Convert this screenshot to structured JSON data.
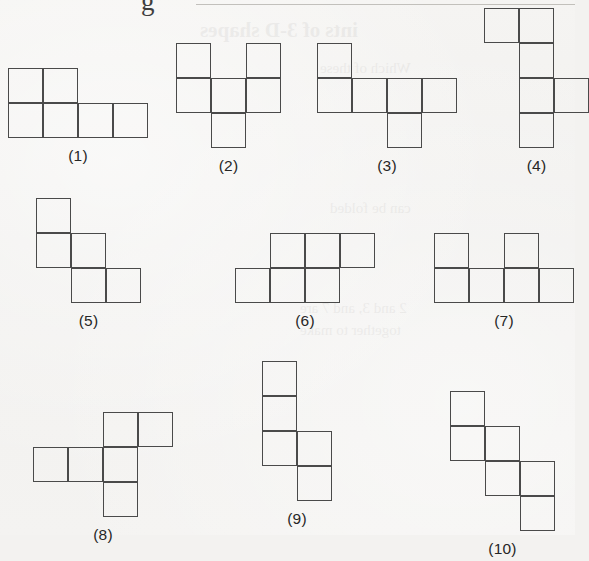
{
  "page": {
    "background_color": "#f3f2f0",
    "ink_color": "#4a4a4a",
    "caption_color": "#262626",
    "cell_size_px": 35,
    "top_glyph": "g",
    "bleed_through_text": [
      "ints of 3-D shapes",
      "Which of these",
      "can be folded",
      "2 and 3, and 7 are",
      "together to make"
    ]
  },
  "figures": [
    {
      "id": "figure-1",
      "caption": "(1)",
      "left": 8,
      "top": 68,
      "cell": 35,
      "cols": 4,
      "rows": 2,
      "cells": [
        {
          "r": 0,
          "c": 0
        },
        {
          "r": 0,
          "c": 1
        },
        {
          "r": 1,
          "c": 0
        },
        {
          "r": 1,
          "c": 1
        },
        {
          "r": 1,
          "c": 2
        },
        {
          "r": 1,
          "c": 3
        }
      ]
    },
    {
      "id": "figure-2",
      "caption": "(2)",
      "left": 176,
      "top": 43,
      "cell": 35,
      "cols": 3,
      "rows": 3,
      "cells": [
        {
          "r": 0,
          "c": 0
        },
        {
          "r": 0,
          "c": 2
        },
        {
          "r": 1,
          "c": 0
        },
        {
          "r": 1,
          "c": 1
        },
        {
          "r": 1,
          "c": 2
        },
        {
          "r": 2,
          "c": 1
        }
      ]
    },
    {
      "id": "figure-3",
      "caption": "(3)",
      "left": 317,
      "top": 43,
      "cell": 35,
      "cols": 4,
      "rows": 3,
      "cells": [
        {
          "r": 0,
          "c": 0
        },
        {
          "r": 1,
          "c": 0
        },
        {
          "r": 1,
          "c": 1
        },
        {
          "r": 1,
          "c": 2
        },
        {
          "r": 1,
          "c": 3
        },
        {
          "r": 2,
          "c": 2
        }
      ]
    },
    {
      "id": "figure-4",
      "caption": "(4)",
      "left": 484,
      "top": 8,
      "cell": 35,
      "cols": 3,
      "rows": 4,
      "cells": [
        {
          "r": 0,
          "c": 0
        },
        {
          "r": 0,
          "c": 1
        },
        {
          "r": 1,
          "c": 1
        },
        {
          "r": 2,
          "c": 1
        },
        {
          "r": 2,
          "c": 2
        },
        {
          "r": 3,
          "c": 1
        }
      ]
    },
    {
      "id": "figure-5",
      "caption": "(5)",
      "left": 36,
      "top": 198,
      "cell": 35,
      "cols": 3,
      "rows": 3,
      "cells": [
        {
          "r": 0,
          "c": 0
        },
        {
          "r": 1,
          "c": 0
        },
        {
          "r": 1,
          "c": 1
        },
        {
          "r": 2,
          "c": 1
        },
        {
          "r": 2,
          "c": 2
        }
      ]
    },
    {
      "id": "figure-6",
      "caption": "(6)",
      "left": 235,
      "top": 233,
      "cell": 35,
      "cols": 4,
      "rows": 2,
      "cells": [
        {
          "r": 0,
          "c": 1
        },
        {
          "r": 0,
          "c": 2
        },
        {
          "r": 0,
          "c": 3
        },
        {
          "r": 1,
          "c": 0
        },
        {
          "r": 1,
          "c": 1
        },
        {
          "r": 1,
          "c": 2
        }
      ]
    },
    {
      "id": "figure-7",
      "caption": "(7)",
      "left": 434,
      "top": 233,
      "cell": 35,
      "cols": 4,
      "rows": 2,
      "cells": [
        {
          "r": 0,
          "c": 0
        },
        {
          "r": 0,
          "c": 2
        },
        {
          "r": 1,
          "c": 0
        },
        {
          "r": 1,
          "c": 1
        },
        {
          "r": 1,
          "c": 2
        },
        {
          "r": 1,
          "c": 3
        }
      ]
    },
    {
      "id": "figure-8",
      "caption": "(8)",
      "left": 33,
      "top": 412,
      "cell": 35,
      "cols": 4,
      "rows": 3,
      "cells": [
        {
          "r": 0,
          "c": 2
        },
        {
          "r": 0,
          "c": 3
        },
        {
          "r": 1,
          "c": 0
        },
        {
          "r": 1,
          "c": 1
        },
        {
          "r": 1,
          "c": 2
        },
        {
          "r": 2,
          "c": 2
        }
      ]
    },
    {
      "id": "figure-9",
      "caption": "(9)",
      "left": 262,
      "top": 361,
      "cell": 35,
      "cols": 2,
      "rows": 4,
      "cells": [
        {
          "r": 0,
          "c": 0
        },
        {
          "r": 1,
          "c": 0
        },
        {
          "r": 2,
          "c": 0
        },
        {
          "r": 2,
          "c": 1
        },
        {
          "r": 3,
          "c": 1
        }
      ]
    },
    {
      "id": "figure-10",
      "caption": "(10)",
      "left": 450,
      "top": 391,
      "cell": 35,
      "cols": 3,
      "rows": 4,
      "cells": [
        {
          "r": 0,
          "c": 0
        },
        {
          "r": 1,
          "c": 0
        },
        {
          "r": 1,
          "c": 1
        },
        {
          "r": 2,
          "c": 1
        },
        {
          "r": 2,
          "c": 2
        },
        {
          "r": 3,
          "c": 2
        }
      ]
    }
  ]
}
